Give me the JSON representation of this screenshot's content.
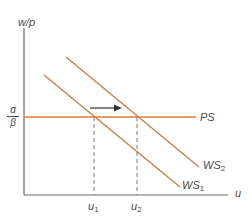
{
  "diagram": {
    "type": "economics-labor-market",
    "axes": {
      "y_label": "w/p",
      "x_label": "u"
    },
    "curves": {
      "ps": {
        "label": "PS",
        "color": "#e07b39"
      },
      "ws1": {
        "label": "WS",
        "sub": "1",
        "color": "#c8804a"
      },
      "ws2": {
        "label": "WS",
        "sub": "2",
        "color": "#c8804a"
      }
    },
    "y_tick": {
      "numerator": "α",
      "denominator": "β"
    },
    "x_ticks": [
      {
        "label": "u",
        "sub": "1"
      },
      {
        "label": "u",
        "sub": "2"
      }
    ],
    "arrow": {
      "direction": "right",
      "meaning": "shift WS1 to WS2"
    },
    "colors": {
      "axis": "#6b6b6b",
      "curve": "#d07a40",
      "ps_line": "#e07b39",
      "dashed": "#777777",
      "arrow": "#333333"
    }
  }
}
